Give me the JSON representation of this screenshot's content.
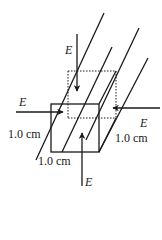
{
  "diagram": {
    "type": "physics-figure",
    "labels": {
      "field_top": "E",
      "field_left": "E",
      "field_right": "E",
      "field_bottom": "E",
      "edge_left": "1.0 cm",
      "edge_right": "1.0 cm",
      "edge_bottom": "1.0 cm"
    },
    "colors": {
      "ink": "#1a1a1a",
      "background": "#ffffff"
    }
  }
}
